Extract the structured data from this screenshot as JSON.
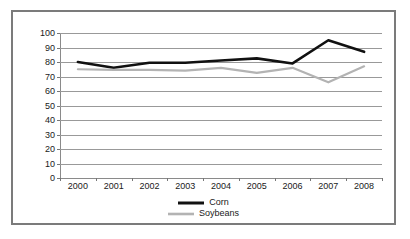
{
  "chart_data": {
    "type": "line",
    "title": "",
    "subtitle": "",
    "xlabel": "",
    "ylabel": "",
    "categories": [
      "2000",
      "2001",
      "2002",
      "2003",
      "2004",
      "2005",
      "2006",
      "2007",
      "2008"
    ],
    "x": [
      2000,
      2001,
      2002,
      2003,
      2004,
      2005,
      2006,
      2007,
      2008
    ],
    "ylim": [
      0,
      100
    ],
    "yticks": [
      0,
      10,
      20,
      30,
      40,
      50,
      60,
      70,
      80,
      90,
      100
    ],
    "grid": "horizontal",
    "legend_position": "bottom-center",
    "series": [
      {
        "name": "Corn",
        "color": "#111111",
        "line_width": 2.6,
        "values": [
          80,
          76,
          79.5,
          79.5,
          81,
          82.5,
          79,
          95,
          87
        ]
      },
      {
        "name": "Soybeans",
        "color": "#b3b3b3",
        "line_width": 2.2,
        "values": [
          75,
          74.5,
          74.5,
          74,
          76,
          72.5,
          76,
          66,
          77
        ]
      }
    ]
  },
  "legend": {
    "entries": [
      {
        "label": "Corn"
      },
      {
        "label": "Soybeans"
      }
    ]
  },
  "colors": {
    "frame_border": "#7b7b7b",
    "gridline": "#999999",
    "axis": "#8a8a8a",
    "tick_text": "#1a1a1a",
    "background": "#ffffff"
  }
}
